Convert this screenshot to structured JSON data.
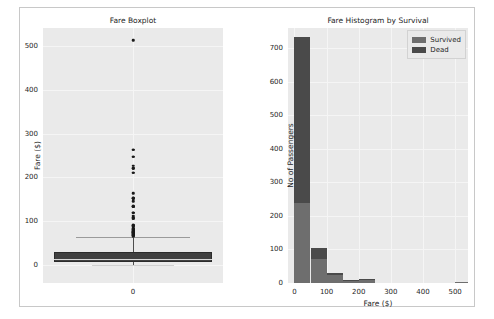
{
  "figure": {
    "background": "#ffffff",
    "plot_background": "#eaeaea",
    "border_color": "#c8c8c8"
  },
  "chart_data": [
    {
      "type": "boxplot",
      "title": "Fare Boxplot",
      "xlabel": "",
      "ylabel": "Fare ($)",
      "ylim": [
        -40,
        540
      ],
      "yticks": [
        0,
        100,
        200,
        300,
        400,
        500
      ],
      "xticks": [
        "0"
      ],
      "grid": true,
      "box_color": "#404040",
      "series": [
        {
          "name": "Fare",
          "q1": 7.9,
          "median": 14.45,
          "q3": 31.0,
          "whisker_low": 0,
          "whisker_high": 65,
          "outliers": [
            512,
            263,
            263,
            247,
            247,
            227,
            221,
            221,
            211,
            211,
            164,
            153,
            153,
            153,
            146,
            135,
            135,
            134,
            134,
            120,
            120,
            120,
            113,
            110,
            108,
            106,
            106,
            93,
            91,
            90,
            90,
            89,
            86,
            83,
            83,
            82,
            81,
            80,
            79,
            78,
            77,
            77,
            76,
            76,
            75,
            73,
            73,
            71,
            71,
            69,
            69,
            67,
            66
          ]
        }
      ]
    },
    {
      "type": "bar",
      "subtype": "stacked-histogram",
      "title": "Fare Histogram by Survival",
      "xlabel": "Fare ($)",
      "ylabel": "No of Passengers",
      "xlim": [
        -20,
        540
      ],
      "ylim": [
        0,
        760
      ],
      "xticks": [
        0,
        100,
        200,
        300,
        400,
        500
      ],
      "yticks": [
        0,
        100,
        200,
        300,
        400,
        500,
        600,
        700
      ],
      "grid": true,
      "legend_position": "upper right",
      "bin_edges": [
        0,
        50,
        100,
        150,
        200,
        250,
        300,
        350,
        400,
        450,
        500,
        550
      ],
      "series": [
        {
          "name": "Survived",
          "color": "#6e6e6e",
          "values": [
            238,
            72,
            25,
            6,
            9,
            0,
            0,
            0,
            0,
            0,
            3
          ]
        },
        {
          "name": "Dead",
          "color": "#4a4a4a",
          "values": [
            494,
            32,
            5,
            2,
            2,
            0,
            0,
            0,
            0,
            0,
            0
          ]
        }
      ]
    }
  ],
  "boxplot_panel": {
    "title": "Fare Boxplot",
    "ylabel": "Fare ($)",
    "yticks": [
      "500",
      "400",
      "300",
      "200",
      "100",
      "0"
    ],
    "xticks": [
      "0"
    ]
  },
  "histogram_panel": {
    "title": "Fare Histogram by Survival",
    "ylabel": "No of Passengers",
    "xlabel": "Fare ($)",
    "yticks": [
      "700",
      "600",
      "500",
      "400",
      "300",
      "200",
      "100",
      "0"
    ],
    "xticks": [
      "0",
      "100",
      "200",
      "300",
      "400",
      "500"
    ],
    "legend": {
      "items": [
        {
          "label": "Survived",
          "color": "#6e6e6e"
        },
        {
          "label": "Dead",
          "color": "#4a4a4a"
        }
      ]
    }
  }
}
